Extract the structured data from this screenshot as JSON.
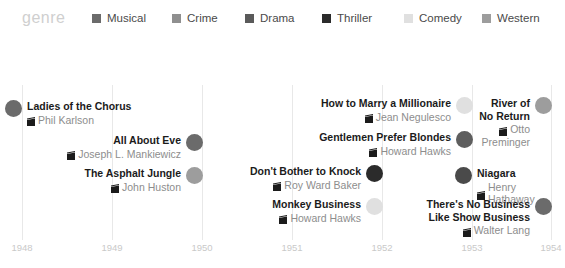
{
  "legend": {
    "title": "genre",
    "items": [
      {
        "label": "Musical",
        "color": "#6b6b6b",
        "left": 92,
        "icon": "square-swatch-icon"
      },
      {
        "label": "Crime",
        "color": "#8f8f8f",
        "left": 172,
        "icon": "square-swatch-icon"
      },
      {
        "label": "Drama",
        "color": "#5a5a5a",
        "left": 245,
        "icon": "square-swatch-icon"
      },
      {
        "label": "Thriller",
        "color": "#2b2b2b",
        "left": 322,
        "icon": "square-swatch-icon"
      },
      {
        "label": "Comedy",
        "color": "#e0e0e0",
        "left": 404,
        "icon": "square-swatch-icon"
      },
      {
        "label": "Western",
        "color": "#9d9d9d",
        "left": 482,
        "icon": "square-swatch-icon"
      }
    ]
  },
  "axis": {
    "ticks": [
      {
        "label": "1948",
        "x": 22
      },
      {
        "label": "1949",
        "x": 112
      },
      {
        "label": "1950",
        "x": 202
      },
      {
        "label": "1951",
        "x": 292
      },
      {
        "label": "1952",
        "x": 382
      },
      {
        "label": "1953",
        "x": 472
      },
      {
        "label": "1954",
        "x": 551
      }
    ]
  },
  "chart_data": {
    "type": "scatter",
    "title": "genre",
    "xlabel": "",
    "ylabel": "",
    "xlim": [
      1948,
      1954
    ],
    "grid": true,
    "legend_position": "top",
    "categories": [
      "Musical",
      "Crime",
      "Drama",
      "Thriller",
      "Comedy",
      "Western"
    ],
    "points": [
      {
        "title": "Ladies of the Chorus",
        "director": "Phil Karlson",
        "year": 1948,
        "genre": "Drama",
        "color": "#6b6b6b"
      },
      {
        "title": "All About Eve",
        "director": "Joseph L. Mankiewicz",
        "year": 1950,
        "genre": "Drama",
        "color": "#6b6b6b"
      },
      {
        "title": "The Asphalt Jungle",
        "director": "John Huston",
        "year": 1950,
        "genre": "Crime",
        "color": "#9d9d9d"
      },
      {
        "title": "How to Marry a Millionaire",
        "director": "Jean Negulesco",
        "year": 1953,
        "genre": "Comedy",
        "color": "#e0e0e0"
      },
      {
        "title": "Gentlemen Prefer Blondes",
        "director": "Howard Hawks",
        "year": 1953,
        "genre": "Musical",
        "color": "#5e5e5e"
      },
      {
        "title": "Don't Bother to Knock",
        "director": "Roy Ward Baker",
        "year": 1952,
        "genre": "Thriller",
        "color": "#2b2b2b"
      },
      {
        "title": "Monkey Business",
        "director": "Howard Hawks",
        "year": 1952,
        "genre": "Comedy",
        "color": "#e0e0e0"
      },
      {
        "title": "River of No Return",
        "director": "Otto Preminger",
        "year": 1954,
        "genre": "Western",
        "color": "#9d9d9d"
      },
      {
        "title": "Niagara",
        "director": "Henry Hathaway",
        "year": 1953,
        "genre": "Thriller",
        "color": "#4a4a4a"
      },
      {
        "title": "There's No Business Like Show Business",
        "director": "Walter Lang",
        "year": 1954,
        "genre": "Musical",
        "color": "#6b6b6b"
      }
    ]
  },
  "films": [
    {
      "title_lines": "Ladies of the Chorus",
      "director_lines": "Phil Karlson",
      "color": "#6b6b6b",
      "align": "left",
      "x": 14,
      "y": 100
    },
    {
      "title_lines": "All About Eve",
      "director_lines": "Joseph L. Mankiewicz",
      "color": "#6b6b6b",
      "align": "right",
      "x": 194,
      "y": 134
    },
    {
      "title_lines": "The Asphalt Jungle",
      "director_lines": "John Huston",
      "color": "#9d9d9d",
      "align": "right",
      "x": 194,
      "y": 167
    },
    {
      "title_lines": "How to Marry a Millionaire",
      "director_lines": "Jean Negulesco",
      "color": "#e0e0e0",
      "align": "right",
      "x": 464,
      "y": 97
    },
    {
      "title_lines": "Gentlemen Prefer Blondes",
      "director_lines": "Howard Hawks",
      "color": "#5e5e5e",
      "align": "right",
      "x": 464,
      "y": 131
    },
    {
      "title_lines": "Don't Bother to Knock",
      "director_lines": "Roy Ward Baker",
      "color": "#2b2b2b",
      "align": "right",
      "x": 374,
      "y": 165
    },
    {
      "title_lines": "Monkey Business",
      "director_lines": "Howard Hawks",
      "color": "#e0e0e0",
      "align": "right",
      "x": 374,
      "y": 198
    },
    {
      "title_lines": "River of\nNo Return",
      "director_lines": "Otto\nPreminger",
      "color": "#9d9d9d",
      "align": "right",
      "x": 543,
      "y": 97
    },
    {
      "title_lines": "Niagara",
      "director_lines": "Henry Hathaway",
      "color": "#4a4a4a",
      "align": "left",
      "x": 464,
      "y": 167
    },
    {
      "title_lines": "There's No Business\nLike Show Business",
      "director_lines": "Walter Lang",
      "color": "#6b6b6b",
      "align": "right",
      "x": 543,
      "y": 198
    }
  ]
}
